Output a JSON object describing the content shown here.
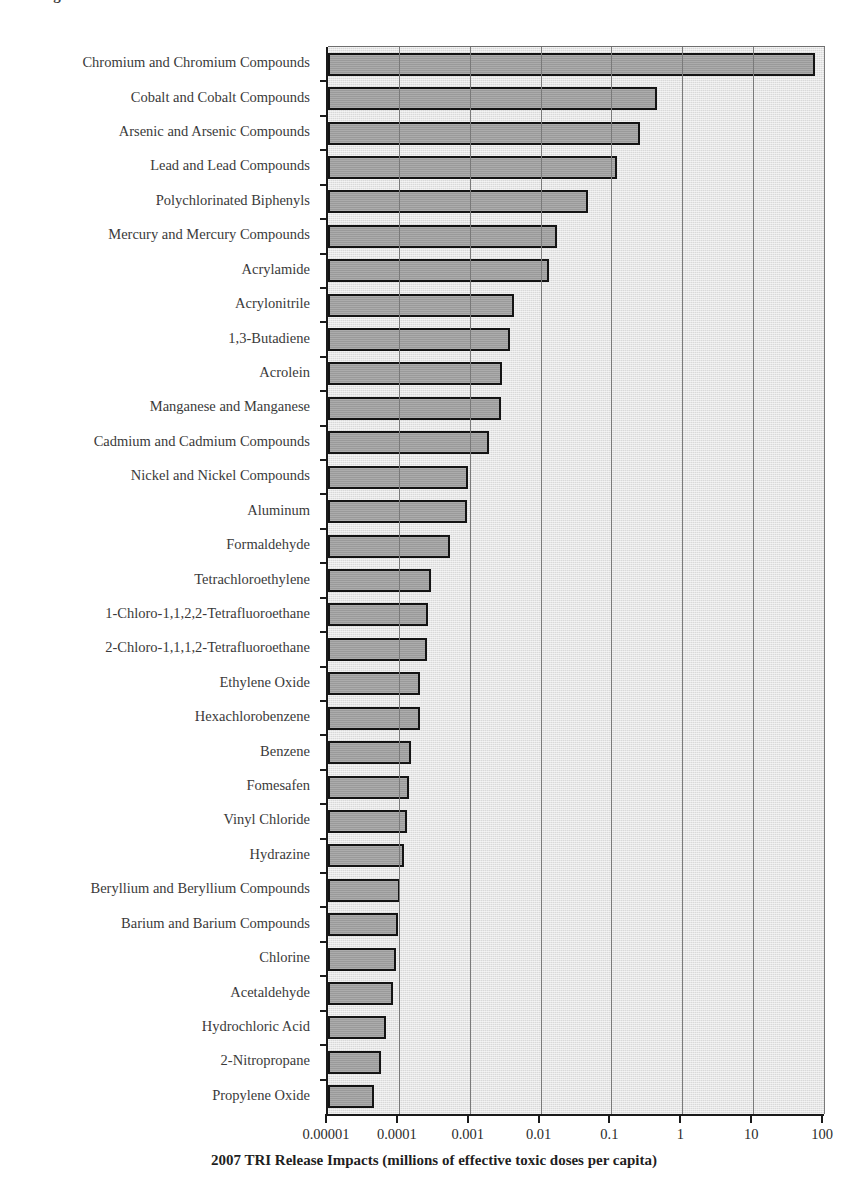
{
  "figure": {
    "cropped_caption_sliver": "Figure",
    "xaxis_title": "2007 TRI Release Impacts (millions of effective toxic doses per capita)"
  },
  "chart_data": {
    "type": "bar",
    "orientation": "horizontal",
    "title": "",
    "xlabel": "2007 TRI Release Impacts (millions of effective toxic doses per capita)",
    "ylabel": "",
    "xscale": "log",
    "xlim": [
      1e-05,
      100
    ],
    "xticks": [
      1e-05,
      0.0001,
      0.001,
      0.01,
      0.1,
      1,
      10,
      100
    ],
    "xticklabels": [
      "0.00001",
      "0.0001",
      "0.001",
      "0.01",
      "0.1",
      "1",
      "10",
      "100"
    ],
    "grid": "vertical",
    "legend": "none",
    "bar_fill_color": "#9a9a9a",
    "bar_edge_color": "#141414",
    "plot_background_color": "#d9d9d9",
    "categories": [
      "Chromium and Chromium Compounds",
      "Cobalt and Cobalt Compounds",
      "Arsenic and Arsenic Compounds",
      "Lead and Lead Compounds",
      "Polychlorinated Biphenyls",
      "Mercury and Mercury Compounds",
      "Acrylamide",
      "Acrylonitrile",
      "1,3-Butadiene",
      "Acrolein",
      "Manganese and Manganese",
      "Cadmium and Cadmium Compounds",
      "Nickel and Nickel Compounds",
      "Aluminum",
      "Formaldehyde",
      "Tetrachloroethylene",
      "1-Chloro-1,1,2,2-Tetrafluoroethane",
      "2-Chloro-1,1,1,2-Tetrafluoroethane",
      "Ethylene Oxide",
      "Hexachlorobenzene",
      "Benzene",
      "Fomesafen",
      "Vinyl Chloride",
      "Hydrazine",
      "Beryllium and Beryllium Compounds",
      "Barium and Barium Compounds",
      "Chlorine",
      "Acetaldehyde",
      "Hydrochloric Acid",
      "2-Nitropropane",
      "Propylene Oxide"
    ],
    "values": [
      74,
      0.44,
      0.25,
      0.12,
      0.046,
      0.017,
      0.013,
      0.0042,
      0.0037,
      0.0029,
      0.0028,
      0.0019,
      0.00095,
      0.00092,
      0.00053,
      0.00028,
      0.00026,
      0.00025,
      0.0002,
      0.0002,
      0.00015,
      0.00014,
      0.00013,
      0.00012,
      0.000104,
      9.6e-05,
      9.2e-05,
      8.4e-05,
      6.5e-05,
      5.6e-05,
      4.4e-05
    ]
  }
}
